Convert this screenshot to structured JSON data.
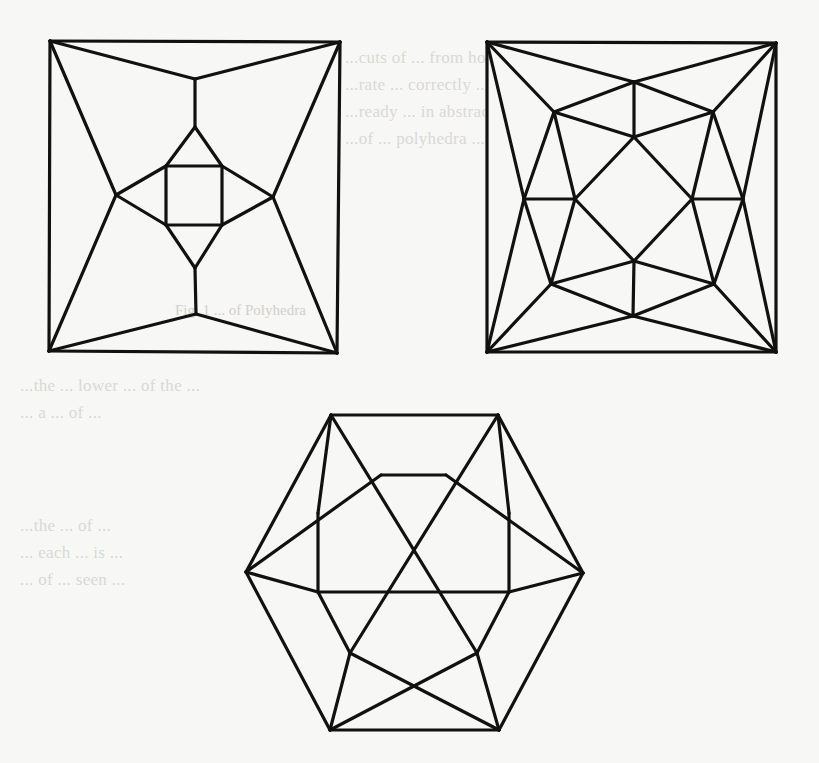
{
  "page": {
    "background": "#f7f7f5",
    "ink_color": "#111111",
    "ghost_ink_color": "#d9d9d6"
  },
  "ghost_text": {
    "top_lines": [
      "...the vertices ...",
      "...cuts of ... from homeomorphism. The first",
      "...rate ... correctly ... characterized. Whitney",
      "...ready ... in abstract ... on ... about",
      "...of ... polyhedra ..."
    ],
    "caption": "Fig. 1  ... of Polyhedra",
    "middle_lines": [
      "...the ... lower ... of the ...",
      "... a ... of ..."
    ],
    "bottom_lines": [
      "...the ... of ...",
      "... each ... is ...",
      "... of ... seen ...",
      "...",
      "..."
    ]
  },
  "figures": [
    {
      "id": "figure-square-inner-square",
      "description": "Square outer face with inner square and diamond (polyhedral graph)",
      "vertices": {
        "TL": [
          50,
          41
        ],
        "TR": [
          340,
          42
        ],
        "BL": [
          49,
          351
        ],
        "BR": [
          337,
          353
        ],
        "T1": [
          195,
          79
        ],
        "T2": [
          195,
          127
        ],
        "B1": [
          196,
          314
        ],
        "B2": [
          195,
          268
        ],
        "L": [
          116,
          195
        ],
        "R": [
          273,
          197
        ],
        "S1": [
          166,
          166
        ],
        "S2": [
          222,
          166
        ],
        "S3": [
          222,
          225
        ],
        "S4": [
          166,
          225
        ]
      },
      "edges": [
        [
          "TL",
          "TR"
        ],
        [
          "TR",
          "BR"
        ],
        [
          "BR",
          "BL"
        ],
        [
          "BL",
          "TL"
        ],
        [
          "TL",
          "T1"
        ],
        [
          "TR",
          "T1"
        ],
        [
          "T1",
          "T2"
        ],
        [
          "BL",
          "B1"
        ],
        [
          "BR",
          "B1"
        ],
        [
          "B1",
          "B2"
        ],
        [
          "TL",
          "L"
        ],
        [
          "BL",
          "L"
        ],
        [
          "TR",
          "R"
        ],
        [
          "BR",
          "R"
        ],
        [
          "T2",
          "S1"
        ],
        [
          "T2",
          "S2"
        ],
        [
          "B2",
          "S4"
        ],
        [
          "B2",
          "S3"
        ],
        [
          "L",
          "S1"
        ],
        [
          "L",
          "S4"
        ],
        [
          "R",
          "S2"
        ],
        [
          "R",
          "S3"
        ],
        [
          "S1",
          "S2"
        ],
        [
          "S2",
          "S3"
        ],
        [
          "S3",
          "S4"
        ],
        [
          "S4",
          "S1"
        ]
      ]
    },
    {
      "id": "figure-square-octagon",
      "description": "Square outer face with inner octagonal star structure (polyhedral graph)",
      "vertices": {
        "TL": [
          487,
          42
        ],
        "TR": [
          776,
          43
        ],
        "BL": [
          487,
          352
        ],
        "BR": [
          776,
          352
        ],
        "TO": [
          634,
          82
        ],
        "TI": [
          634,
          137
        ],
        "UL": [
          554,
          112
        ],
        "UR": [
          713,
          112
        ],
        "LO": [
          524,
          199
        ],
        "LI": [
          575,
          199
        ],
        "RI": [
          692,
          199
        ],
        "RO": [
          743,
          199
        ],
        "DL": [
          551,
          284
        ],
        "DR": [
          714,
          284
        ],
        "BI": [
          634,
          261
        ],
        "BO": [
          633,
          316
        ]
      },
      "edges": [
        [
          "TL",
          "TR"
        ],
        [
          "TR",
          "BR"
        ],
        [
          "BR",
          "BL"
        ],
        [
          "BL",
          "TL"
        ],
        [
          "TL",
          "TO"
        ],
        [
          "TR",
          "TO"
        ],
        [
          "TO",
          "TI"
        ],
        [
          "TL",
          "UL"
        ],
        [
          "TR",
          "UR"
        ],
        [
          "UL",
          "TO"
        ],
        [
          "UR",
          "TO"
        ],
        [
          "UL",
          "TI"
        ],
        [
          "UR",
          "TI"
        ],
        [
          "TL",
          "LO"
        ],
        [
          "BL",
          "LO"
        ],
        [
          "TR",
          "RO"
        ],
        [
          "BR",
          "RO"
        ],
        [
          "UL",
          "LO"
        ],
        [
          "UL",
          "LI"
        ],
        [
          "UR",
          "RO"
        ],
        [
          "UR",
          "RI"
        ],
        [
          "LO",
          "LI"
        ],
        [
          "RO",
          "RI"
        ],
        [
          "TI",
          "LI"
        ],
        [
          "TI",
          "RI"
        ],
        [
          "BI",
          "LI"
        ],
        [
          "BI",
          "RI"
        ],
        [
          "LO",
          "DL"
        ],
        [
          "LI",
          "DL"
        ],
        [
          "RO",
          "DR"
        ],
        [
          "RI",
          "DR"
        ],
        [
          "DL",
          "BI"
        ],
        [
          "DR",
          "BI"
        ],
        [
          "BI",
          "BO"
        ],
        [
          "DL",
          "BO"
        ],
        [
          "DR",
          "BO"
        ],
        [
          "BL",
          "DL"
        ],
        [
          "BR",
          "DR"
        ],
        [
          "BL",
          "BO"
        ],
        [
          "BR",
          "BO"
        ]
      ]
    },
    {
      "id": "figure-hexagon",
      "description": "Hexagonal outer face with inner square and crossing diagonals (polyhedral graph)",
      "vertices": {
        "HTL": [
          331,
          415
        ],
        "HTR": [
          498,
          415
        ],
        "HL": [
          246,
          572
        ],
        "HR": [
          583,
          573
        ],
        "HBL": [
          330,
          730
        ],
        "HBR": [
          499,
          730
        ],
        "ITL": [
          381,
          475
        ],
        "ITR": [
          446,
          475
        ],
        "ML": [
          318,
          513
        ],
        "MR": [
          509,
          513
        ],
        "SBL": [
          318,
          592
        ],
        "SBR": [
          509,
          592
        ],
        "LL": [
          350,
          653
        ],
        "LR": [
          477,
          653
        ]
      },
      "edges": [
        [
          "HTL",
          "HTR"
        ],
        [
          "HTR",
          "HR"
        ],
        [
          "HR",
          "HBR"
        ],
        [
          "HBR",
          "HBL"
        ],
        [
          "HBL",
          "HL"
        ],
        [
          "HL",
          "HTL"
        ],
        [
          "HTL",
          "ML"
        ],
        [
          "ML",
          "SBL"
        ],
        [
          "SBL",
          "LL"
        ],
        [
          "LL",
          "HBL"
        ],
        [
          "HTR",
          "MR"
        ],
        [
          "MR",
          "SBR"
        ],
        [
          "SBR",
          "LR"
        ],
        [
          "LR",
          "HBR"
        ],
        [
          "HTL",
          "LR"
        ],
        [
          "HTR",
          "LL"
        ],
        [
          "ITL",
          "ITR"
        ],
        [
          "ITL",
          "HL"
        ],
        [
          "ITR",
          "HR"
        ],
        [
          "HL",
          "SBL"
        ],
        [
          "HR",
          "SBR"
        ],
        [
          "SBL",
          "SBR"
        ],
        [
          "LL",
          "HBR"
        ],
        [
          "LR",
          "HBL"
        ]
      ]
    }
  ]
}
